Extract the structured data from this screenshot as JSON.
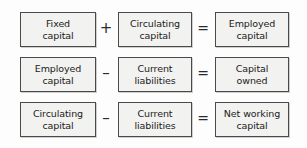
{
  "diagram": {
    "type": "equation-diagram",
    "background_color": "#fdfdfd",
    "box_fill_color": "#f2f2f0",
    "box_border_color": "#4a4a4a",
    "text_color": "#1b1b1b",
    "rows": [
      {
        "left_term": "Fixed\ncapital",
        "operator_1": "+",
        "middle_term": "Circulating\ncapital",
        "operator_2": "=",
        "right_term": "Employed\ncapital"
      },
      {
        "left_term": "Employed\ncapital",
        "operator_1": "–",
        "middle_term": "Current\nliabilities",
        "operator_2": "=",
        "right_term": "Capital\nowned"
      },
      {
        "left_term": "Circulating\ncapital",
        "operator_1": "–",
        "middle_term": "Current\nliabilities",
        "operator_2": "=",
        "right_term": "Net working\ncapital"
      }
    ]
  }
}
